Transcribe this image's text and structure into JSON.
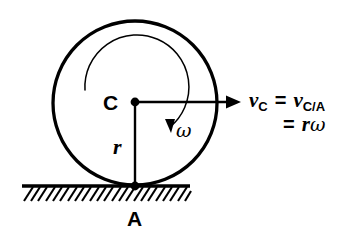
{
  "figure": {
    "background_color": "#ffffff",
    "stroke_color": "#000000"
  },
  "labels": {
    "center_point": "C",
    "contact_point": "A",
    "radius": "r",
    "angular_velocity": "ω"
  },
  "equation": {
    "line1": {
      "lhs_symbol": "v",
      "lhs_subscript": "C",
      "equals": "=",
      "rhs_symbol": "v",
      "rhs_subscript": "C/A"
    },
    "line2": {
      "equals": "=",
      "radius_symbol": "r",
      "omega_symbol": "ω"
    }
  },
  "geometry": {
    "circle": {
      "cx": 135,
      "cy": 103,
      "r": 82
    },
    "center_dot": {
      "cx": 135,
      "cy": 103,
      "r": 4.2
    },
    "contact_dot": {
      "cx": 135,
      "cy": 186,
      "r": 4.2
    },
    "velocity_arrow": {
      "x1": 135,
      "y1": 102,
      "x2": 232,
      "y2": 102
    },
    "radius_line": {
      "x1": 135,
      "y1": 103,
      "x2": 135,
      "y2": 186
    },
    "ground_line": {
      "x1": 22,
      "y1": 186,
      "x2": 190,
      "y2": 186
    },
    "hatch": {
      "count": 23,
      "start_x": 24,
      "spacing": 7.3,
      "depth": 14,
      "slant": 9
    },
    "spin_arc": {
      "cx": 135,
      "cy": 103,
      "r": 52,
      "start_deg": 195,
      "end_deg": 28
    }
  }
}
